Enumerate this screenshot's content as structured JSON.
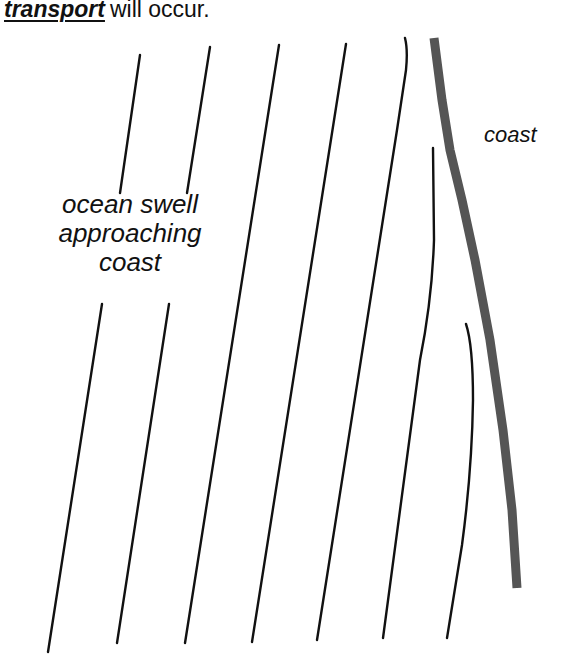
{
  "heading": {
    "emphasis": "transport",
    "rest": "will occur."
  },
  "labels": {
    "swell_line1": "ocean swell",
    "swell_line2": "approaching",
    "swell_line3": "coast",
    "coast": "coast"
  },
  "colors": {
    "wave_line": "#111111",
    "coastline": "#555555",
    "background": "#ffffff"
  }
}
